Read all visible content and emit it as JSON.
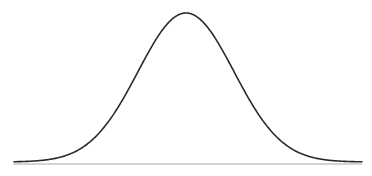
{
  "figure": {
    "width": 372,
    "height": 176,
    "background_color": "#ffffff"
  },
  "chart_data": {
    "type": "line",
    "title": "",
    "subtitle": "",
    "xlabel": "",
    "ylabel": "",
    "grid": false,
    "legend": [],
    "legend_position": "none",
    "annotations": [],
    "xticks": [],
    "yticks": [],
    "xtick_labels": [],
    "ytick_labels": [],
    "series": [
      {
        "name": "normal-distribution-curve",
        "kind": "gaussian",
        "color": "#2b2b2b",
        "line_width": 1.6,
        "peak_x": 186,
        "peak_y_px": 13,
        "baseline_y_px": 162,
        "sigma_px": 48,
        "fwhm_px": 113,
        "x_start": 14,
        "x_end": 362,
        "x": [
          14,
          24,
          34,
          44,
          54,
          64,
          74,
          84,
          94,
          104,
          114,
          124,
          134,
          144,
          154,
          164,
          174,
          186,
          198,
          208,
          218,
          228,
          238,
          248,
          258,
          268,
          278,
          288,
          298,
          308,
          318,
          328,
          338,
          348,
          358,
          362
        ],
        "y": [
          158.7,
          158.3,
          157.6,
          156.6,
          155.1,
          152.9,
          149.9,
          145.8,
          140.5,
          133.7,
          125.5,
          115.9,
          105.1,
          93.4,
          81.3,
          69.4,
          58.5,
          48.6,
          48.6,
          55.0,
          64.9,
          76.4,
          88.7,
          100.6,
          111.4,
          120.6,
          128.2,
          134.2,
          138.9,
          142.4,
          145.0,
          146.9,
          148.2,
          149.2,
          149.8,
          150.0
        ],
        "normalized_x": [
          -3.58,
          -3.38,
          -3.17,
          -2.96,
          -2.75,
          -2.54,
          -2.33,
          -2.13,
          -1.92,
          -1.71,
          -1.5,
          -1.29,
          -1.08,
          -0.88,
          -0.67,
          -0.46,
          -0.25,
          0.0,
          0.25,
          0.46,
          0.67,
          0.88,
          1.08,
          1.29,
          1.5,
          1.71,
          1.92,
          2.13,
          2.33,
          2.54,
          2.75,
          2.96,
          3.17,
          3.38,
          3.58,
          3.67
        ],
        "normalized_y": [
          0.001,
          0.003,
          0.006,
          0.013,
          0.023,
          0.04,
          0.065,
          0.103,
          0.157,
          0.23,
          0.325,
          0.437,
          0.559,
          0.678,
          0.798,
          0.9,
          0.97,
          1.0,
          0.97,
          0.9,
          0.798,
          0.678,
          0.559,
          0.437,
          0.325,
          0.23,
          0.157,
          0.103,
          0.065,
          0.04,
          0.023,
          0.013,
          0.006,
          0.003,
          0.001,
          0.001
        ]
      }
    ],
    "axis": {
      "name": "baseline-axis",
      "color": "#a9a9a9",
      "line_width": 1.1,
      "y_px": 164,
      "x_start": 13,
      "x_end": 362
    },
    "xlim": [
      -3.7,
      3.7
    ],
    "ylim": [
      0,
      1.05
    ]
  }
}
